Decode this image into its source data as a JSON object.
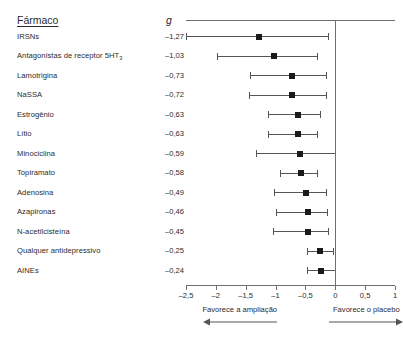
{
  "header": {
    "drug_label": "Fármaco",
    "effect_label": "g"
  },
  "chart_data": {
    "type": "forest",
    "title": "",
    "xlabel": "",
    "ylabel": "",
    "xlim": [
      -2.5,
      1
    ],
    "xticks": [
      -2.5,
      -2,
      -1.5,
      -1,
      -0.5,
      0,
      0.5,
      1
    ],
    "xtick_labels": [
      "–2,5",
      "–2",
      "–1,5",
      "–1",
      "–0,5",
      "0",
      "0,5",
      "1"
    ],
    "grid": false,
    "null_line": 0,
    "effect_measure": "g",
    "categories": [
      "IRSNs",
      "Antagonistas de receptor 5HT3",
      "Lamotrigina",
      "NaSSA",
      "Estrogênio",
      "Lítio",
      "Minociclina",
      "Topiramato",
      "Adenosina",
      "Azapironas",
      "N-acetilcisteína",
      "Qualquer antidepressivo",
      "AINEs"
    ],
    "rows": [
      {
        "label": "IRSNs",
        "label_html": "IRSNs",
        "value_text": "–1,27",
        "value": -1.27,
        "ci_low": -2.5,
        "ci_high": -0.12
      },
      {
        "label": "Antagonistas de receptor 5HT3",
        "label_html": "Antagonistas de receptor 5HT<sub>3</sub>",
        "value_text": "–1,03",
        "value": -1.03,
        "ci_low": -1.98,
        "ci_high": -0.3
      },
      {
        "label": "Lamotrigina",
        "label_html": "Lamotrigina",
        "value_text": "–0,73",
        "value": -0.73,
        "ci_low": -1.43,
        "ci_high": -0.15
      },
      {
        "label": "NaSSA",
        "label_html": "NaSSA",
        "value_text": "–0,72",
        "value": -0.72,
        "ci_low": -1.44,
        "ci_high": -0.16
      },
      {
        "label": "Estrogênio",
        "label_html": "Estrogênio",
        "value_text": "–0,63",
        "value": -0.63,
        "ci_low": -1.13,
        "ci_high": -0.26
      },
      {
        "label": "Lítio",
        "label_html": "Lítio",
        "value_text": "–0,63",
        "value": -0.63,
        "ci_low": -1.12,
        "ci_high": -0.3
      },
      {
        "label": "Minociclina",
        "label_html": "Minociclina",
        "value_text": "–0,59",
        "value": -0.59,
        "ci_low": -1.32,
        "ci_high": -0.01
      },
      {
        "label": "Topiramato",
        "label_html": "Topiramato",
        "value_text": "–0,58",
        "value": -0.58,
        "ci_low": -0.92,
        "ci_high": -0.3
      },
      {
        "label": "Adenosina",
        "label_html": "Adenosina",
        "value_text": "–0,49",
        "value": -0.49,
        "ci_low": -1.03,
        "ci_high": -0.16
      },
      {
        "label": "Azapironas",
        "label_html": "Azapironas",
        "value_text": "–0,46",
        "value": -0.46,
        "ci_low": -1.0,
        "ci_high": -0.14
      },
      {
        "label": "N-acetilcisteína",
        "label_html": "N-acetilcisteína",
        "value_text": "–0,45",
        "value": -0.45,
        "ci_low": -1.05,
        "ci_high": -0.12
      },
      {
        "label": "Qualquer antidepressivo",
        "label_html": "Qualquer antidepressivo",
        "value_text": "–0,25",
        "value": -0.25,
        "ci_low": -0.48,
        "ci_high": -0.03
      },
      {
        "label": "AINEs",
        "label_html": "AINEs",
        "value_text": "–0,24",
        "value": -0.24,
        "ci_low": -0.47,
        "ci_high": -0.01
      }
    ],
    "annotations": {
      "left": "Favorece a ampliação",
      "right": "Favorece o placebo"
    }
  },
  "colors": {
    "marker": "#1a1a1a",
    "ci": "#555555",
    "axis": "#6e6e6e",
    "text": "#2b2b2b",
    "background": "#ffffff"
  }
}
